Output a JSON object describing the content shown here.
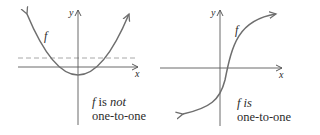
{
  "panels": [
    {
      "id": "left",
      "axis_x_label": "x",
      "axis_y_label": "y",
      "curve_label": "f",
      "caption_line1_f": "f",
      "caption_line1_is": " is ",
      "caption_line1_emph": "not",
      "caption_line2": "one-to-one",
      "curve_type": "parabola",
      "has_horizontal_test_line": true
    },
    {
      "id": "right",
      "axis_x_label": "x",
      "axis_y_label": "y",
      "curve_label": "f",
      "caption_line1_f": "f",
      "caption_line1_is": " is",
      "caption_line2": "one-to-one",
      "curve_type": "increasing S-curve",
      "has_horizontal_test_line": false
    }
  ],
  "colors": {
    "axis": "#5a5a5a",
    "curve": "#6e6e6e",
    "dashed_line": "#a8a8a8",
    "text": "#2b2b2b"
  }
}
